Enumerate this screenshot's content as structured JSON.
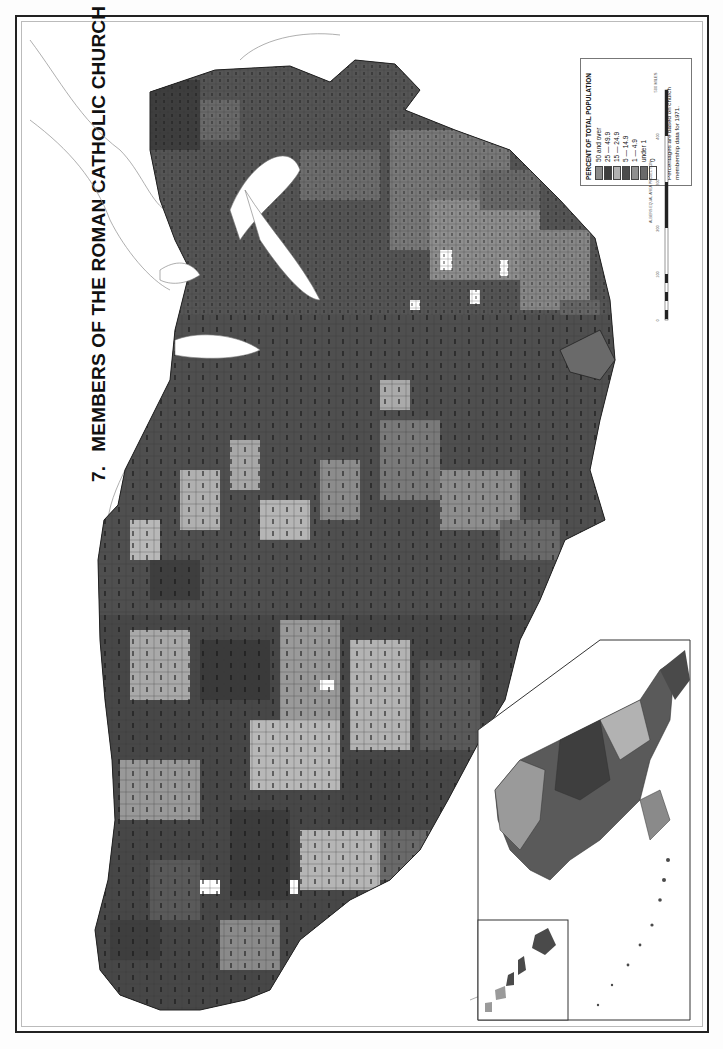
{
  "title": {
    "number": "7.",
    "text": "MEMBERS OF THE ROMAN CATHOLIC CHURCH (By County)"
  },
  "legend": {
    "title": "PERCENT OF TOTAL POPULATION",
    "classes": [
      {
        "label": "50 and over",
        "color": "#8a8a8a"
      },
      {
        "label": "25 — 49.9",
        "color": "#3e3e3e"
      },
      {
        "label": "15 — 24.9",
        "color": "#b2b2b2"
      },
      {
        "label": "5 — 14.9",
        "color": "#4c4c4c"
      },
      {
        "label": "1 — 4.9",
        "color": "#8f8f8f"
      },
      {
        "label": "under 1",
        "color": "#6a6a6a"
      },
      {
        "label": "0",
        "color": "#ffffff"
      }
    ],
    "note": "Percentages are based on church membership data for 1971."
  },
  "scale_bar": {
    "ticks": [
      "0",
      "100",
      "200",
      "300",
      "400",
      "500 MILES"
    ],
    "projection": "ALBERS EQUAL AREA PROJECTION"
  },
  "insets": {
    "alaska": {
      "label": "Alaska"
    },
    "hawaii": {
      "label": "Hawaii"
    }
  },
  "colors": {
    "frame": "#222222",
    "background": "#ffffff",
    "dark": "#444444",
    "medium": "#6a6a6a",
    "light": "#b5b5b5",
    "water_line": "#9a9a9a"
  }
}
